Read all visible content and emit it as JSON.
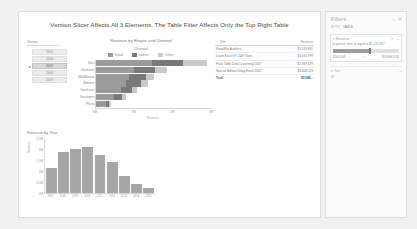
{
  "report": {
    "title": "Version Slicer Affects All 3 Elements. The Table Filter Affects Only the Top Right Table"
  },
  "slicer": {
    "header": "Version",
    "items": [
      {
        "label": "2006",
        "selected": false,
        "marker": ""
      },
      {
        "label": "2006",
        "selected": false,
        "marker": ""
      },
      {
        "label": "2007",
        "selected": true,
        "marker": "▸"
      },
      {
        "label": "2008",
        "selected": false,
        "marker": ""
      },
      {
        "label": "2009",
        "selected": false,
        "marker": ""
      }
    ]
  },
  "filters": {
    "title": "Filters",
    "collapse_icon": "‹",
    "close_icon": "✕",
    "crumb_label": "ATTR",
    "crumb_value": "TABLE",
    "card": {
      "name": "▾  Revenue",
      "filter_icon": "↺",
      "more_icon": "⋯",
      "condition": "is greater than or equal to $1,125,947",
      "range_min": "$16,564",
      "range_mid": "▸",
      "range_max": "$3,806,125"
    },
    "second": {
      "label": "▾  Year",
      "more_icon": "⋯",
      "sub": "All"
    }
  },
  "table": {
    "columns": [
      "Title",
      "Revenue"
    ],
    "sort_icon": "⌃",
    "rows": [
      {
        "title": "Road Pro Auditors",
        "revenue": "$1,249,881"
      },
      {
        "title": "Learn Excel 97-2007 from...",
        "revenue": "$3,032,799"
      },
      {
        "title": "Pivot Table Data Crunching 2007",
        "revenue": "$1,387,129"
      },
      {
        "title": "Special Edition Using Excel 2007",
        "revenue": "$3,608,523"
      }
    ],
    "total": {
      "title": "Total",
      "revenue": "$9,598..."
    }
  },
  "chart_data": [
    {
      "type": "bar",
      "title": "Revenue by Region and Channel",
      "legend_title": "Channel",
      "legend_position": "top",
      "categories": [
        "East",
        "Northeast",
        "Mid/Atlantic",
        "Midwest",
        "Southeast",
        "Southwest",
        "Plains"
      ],
      "series": [
        {
          "name": "Retail",
          "color": "#9a9a9a",
          "values": [
            1450000,
            980000,
            870000,
            790000,
            640000,
            470000,
            250000
          ]
        },
        {
          "name": "Indirect",
          "color": "#787878",
          "values": [
            830000,
            560000,
            430000,
            380000,
            300000,
            210000,
            95000
          ]
        },
        {
          "name": "Online",
          "color": "#c9c9c9",
          "values": [
            620000,
            300000,
            210000,
            180000,
            140000,
            110000,
            55000
          ]
        }
      ],
      "xlabel": "Revenue",
      "ylabel": "",
      "xticks": [
        "0M",
        "1M",
        "2M",
        "3M"
      ],
      "xlim": [
        0,
        3000000
      ],
      "grid": false
    },
    {
      "type": "bar",
      "title": "Revenue by Year",
      "categories": [
        "2007",
        "2008",
        "2009",
        "2010",
        "2011",
        "2012",
        "2013",
        "2014",
        "2015"
      ],
      "values": [
        1180000,
        1900000,
        2050000,
        2150000,
        1750000,
        1450000,
        780000,
        420000,
        210000
      ],
      "ylabel": "Revenue",
      "xlabel": "",
      "yticks": [
        "2.5M",
        "2M",
        "1.5M",
        "1M",
        "0.5M",
        "0M"
      ],
      "ylim": [
        0,
        2500000
      ],
      "grid": false
    }
  ]
}
